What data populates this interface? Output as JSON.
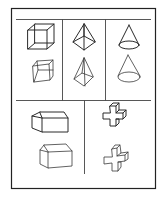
{
  "sheet": {
    "background": "#ffffff",
    "ink_color": "#2a2a2a",
    "layout": {
      "top_row_columns": 3,
      "bottom_row_columns": 2
    },
    "cells": [
      {
        "position": "top-left",
        "shape": "cube",
        "model": "wireframe-cube",
        "copy": "hand-drawn-cube"
      },
      {
        "position": "top-middle",
        "shape": "pyramid",
        "model": "wireframe-pyramid",
        "copy": "hand-drawn-pyramid"
      },
      {
        "position": "top-right",
        "shape": "cone",
        "model": "wireframe-cone",
        "copy": "hand-drawn-cone"
      },
      {
        "position": "bottom-left",
        "shape": "house",
        "model": "house-block",
        "copy": "hand-drawn-house-block"
      },
      {
        "position": "bottom-right",
        "shape": "cross",
        "model": "3d-cross",
        "copy": "hand-drawn-3d-cross"
      }
    ]
  }
}
